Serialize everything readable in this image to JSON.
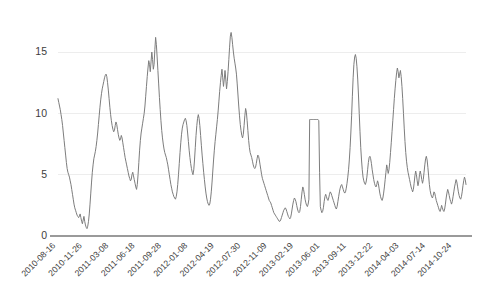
{
  "chart_data": {
    "type": "line",
    "title": "",
    "subtitle": "",
    "xlabel": "",
    "ylabel": "",
    "legend": [],
    "legend_position": "none",
    "grid": true,
    "grid_axis": "y",
    "line_color": "#7d7d7d",
    "axis_color": "#9a9a9a",
    "grid_color": "#ededed",
    "background_color": "#ffffff",
    "ylim": [
      0,
      16.8
    ],
    "yticks": [
      0,
      5,
      10,
      15
    ],
    "ytick_labels": [
      "0",
      "5",
      "10",
      "15"
    ],
    "xtick_labels": [
      "2010-08-16",
      "2010-11-26",
      "2011-03-08",
      "2011-06-18",
      "2011-09-28",
      "2012-01-08",
      "2012-04-19",
      "2012-07-30",
      "2012-11-09",
      "2013-02-19",
      "2013-06-01",
      "2013-09-11",
      "2013-12-22",
      "2014-04-03",
      "2014-07-14",
      "2014-10-24"
    ],
    "x_start": "2010-08-16",
    "x_end": "2014-12-31",
    "n_points": 407,
    "values": [
      11.2,
      10.9,
      10.6,
      10.3,
      9.9,
      9.5,
      9.0,
      8.4,
      7.8,
      7.2,
      6.6,
      6.0,
      5.5,
      5.2,
      5.0,
      4.8,
      4.5,
      4.2,
      3.8,
      3.4,
      3.0,
      2.6,
      2.3,
      2.1,
      1.9,
      1.7,
      1.6,
      1.5,
      1.6,
      1.8,
      1.5,
      1.2,
      1.0,
      1.3,
      1.6,
      1.2,
      0.9,
      0.7,
      0.6,
      0.8,
      1.2,
      1.8,
      2.6,
      3.5,
      4.4,
      5.2,
      5.8,
      6.3,
      6.6,
      6.9,
      7.3,
      7.8,
      8.4,
      9.1,
      9.8,
      10.5,
      11.1,
      11.6,
      12.0,
      12.3,
      12.6,
      12.9,
      13.1,
      13.2,
      13.0,
      12.5,
      11.9,
      11.2,
      10.5,
      9.9,
      9.4,
      9.0,
      8.7,
      8.5,
      8.6,
      9.0,
      9.3,
      9.1,
      8.7,
      8.3,
      8.0,
      7.8,
      7.9,
      8.2,
      8.0,
      7.6,
      7.2,
      6.8,
      6.4,
      6.1,
      5.8,
      5.5,
      5.2,
      4.9,
      4.7,
      4.5,
      4.6,
      5.0,
      5.2,
      4.9,
      4.6,
      4.3,
      4.0,
      3.8,
      4.2,
      5.0,
      6.0,
      7.0,
      7.8,
      8.4,
      8.8,
      9.2,
      9.6,
      10.0,
      10.6,
      11.4,
      12.2,
      13.0,
      13.7,
      14.3,
      14.0,
      13.4,
      14.2,
      15.0,
      14.4,
      13.6,
      14.0,
      15.2,
      16.2,
      15.6,
      14.6,
      13.5,
      12.4,
      11.3,
      10.3,
      9.4,
      8.6,
      8.0,
      7.5,
      7.1,
      6.8,
      6.6,
      6.4,
      6.1,
      5.8,
      5.4,
      5.0,
      4.6,
      4.2,
      3.9,
      3.6,
      3.4,
      3.2,
      3.1,
      3.0,
      3.2,
      3.6,
      4.2,
      5.0,
      5.9,
      6.8,
      7.6,
      8.3,
      8.8,
      9.1,
      9.3,
      9.5,
      9.6,
      9.4,
      9.0,
      8.4,
      7.7,
      7.0,
      6.4,
      5.9,
      5.5,
      5.2,
      5.0,
      5.4,
      6.2,
      7.2,
      8.2,
      9.0,
      9.6,
      9.9,
      9.6,
      9.0,
      8.2,
      7.4,
      6.6,
      5.9,
      5.2,
      4.6,
      4.0,
      3.5,
      3.1,
      2.8,
      2.6,
      2.5,
      2.6,
      3.0,
      3.6,
      4.4,
      5.3,
      6.2,
      7.0,
      7.7,
      8.3,
      8.9,
      9.5,
      10.2,
      11.0,
      11.8,
      12.5,
      13.1,
      13.6,
      12.9,
      12.2,
      12.8,
      13.5,
      12.8,
      12.0,
      12.6,
      13.4,
      14.4,
      15.4,
      16.3,
      16.6,
      16.2,
      15.6,
      15.0,
      14.5,
      14.1,
      13.7,
      13.2,
      12.4,
      11.5,
      10.6,
      9.8,
      9.1,
      8.6,
      8.2,
      8.0,
      8.3,
      9.0,
      9.8,
      10.4,
      10.1,
      9.4,
      8.6,
      7.8,
      7.2,
      6.8,
      6.6,
      6.4,
      6.1,
      5.8,
      5.6,
      5.5,
      5.6,
      5.9,
      6.3,
      6.6,
      6.5,
      6.2,
      5.8,
      5.4,
      5.0,
      4.7,
      4.5,
      4.3,
      4.1,
      3.9,
      3.7,
      3.5,
      3.3,
      3.1,
      2.9,
      2.8,
      2.7,
      2.5,
      2.3,
      2.1,
      1.9,
      1.8,
      1.7,
      1.6,
      1.5,
      1.4,
      1.3,
      1.2,
      1.2,
      1.3,
      1.5,
      1.7,
      1.9,
      2.1,
      2.2,
      2.3,
      2.2,
      2.0,
      1.8,
      1.6,
      1.5,
      1.4,
      1.5,
      1.8,
      2.2,
      2.6,
      2.9,
      3.1,
      3.0,
      2.8,
      2.5,
      2.2,
      2.0,
      1.9,
      2.0,
      2.4,
      3.0,
      3.6,
      4.0,
      3.8,
      3.4,
      3.0,
      2.7,
      2.5,
      2.4,
      2.6,
      3.0,
      9.5,
      9.5,
      9.5,
      9.5,
      9.5,
      9.5,
      9.5,
      9.5,
      9.5,
      9.5,
      9.5,
      9.5,
      9.4,
      5.2,
      2.4,
      2.1,
      1.9,
      2.0,
      2.3,
      2.8,
      3.2,
      3.4,
      3.2,
      3.0,
      2.9,
      3.1,
      3.4,
      3.6,
      3.5,
      3.3,
      3.1,
      2.9,
      2.7,
      2.5,
      2.3,
      2.2,
      2.4,
      2.8,
      3.2,
      3.6,
      3.9,
      4.1,
      4.2,
      4.0,
      3.8,
      3.6,
      3.5,
      3.6,
      3.9,
      4.3,
      4.8,
      5.4,
      6.2,
      7.2,
      8.4,
      9.8,
      11.4,
      12.9,
      14.0,
      14.6,
      14.8,
      14.5,
      13.8,
      12.8,
      11.5,
      10.0,
      8.5,
      7.2,
      6.2,
      5.4,
      4.8,
      4.5,
      4.3,
      4.2,
      4.4,
      4.8,
      5.4,
      6.0,
      6.4,
      6.5,
      6.3,
      5.9,
      5.4,
      5.0,
      4.6,
      4.3,
      4.1,
      4.0,
      4.2,
      4.5,
      4.3,
      3.9,
      3.5,
      3.2,
      3.0,
      2.9,
      3.1,
      3.5,
      4.0,
      4.6,
      5.2,
      5.8,
      5.5,
      5.1,
      5.4,
      6.0,
      6.8,
      7.6,
      8.5,
      9.4,
      10.3,
      11.2,
      12.0,
      12.7,
      13.3,
      13.7,
      13.4,
      12.9,
      13.2,
      13.5,
      13.0,
      12.2,
      11.2,
      10.0,
      8.8,
      7.7,
      6.8,
      6.1,
      5.6,
      5.2,
      4.9,
      4.6,
      4.3,
      4.0,
      3.8,
      3.6,
      3.8,
      4.3,
      4.9,
      5.3,
      5.0,
      4.5,
      4.1,
      4.4,
      5.0,
      5.3,
      5.0,
      4.6,
      4.3,
      4.6,
      5.2,
      5.8,
      6.3,
      6.5,
      6.2,
      5.6,
      4.9,
      4.2,
      3.7,
      3.4,
      3.2,
      3.1,
      3.3,
      3.6,
      3.5,
      3.2,
      2.9,
      2.7,
      2.5,
      2.3,
      2.1,
      2.0,
      2.2,
      2.5,
      2.3,
      2.1,
      2.0,
      2.2,
      2.6,
      3.1,
      3.5,
      3.8,
      3.6,
      3.3,
      3.0,
      2.8,
      2.6,
      2.8,
      3.2,
      3.6,
      4.0,
      4.3,
      4.6,
      4.4,
      4.0,
      3.6,
      3.3,
      3.1,
      3.0,
      3.2,
      3.6,
      4.1,
      4.5,
      4.8,
      4.6,
      4.2
    ]
  }
}
